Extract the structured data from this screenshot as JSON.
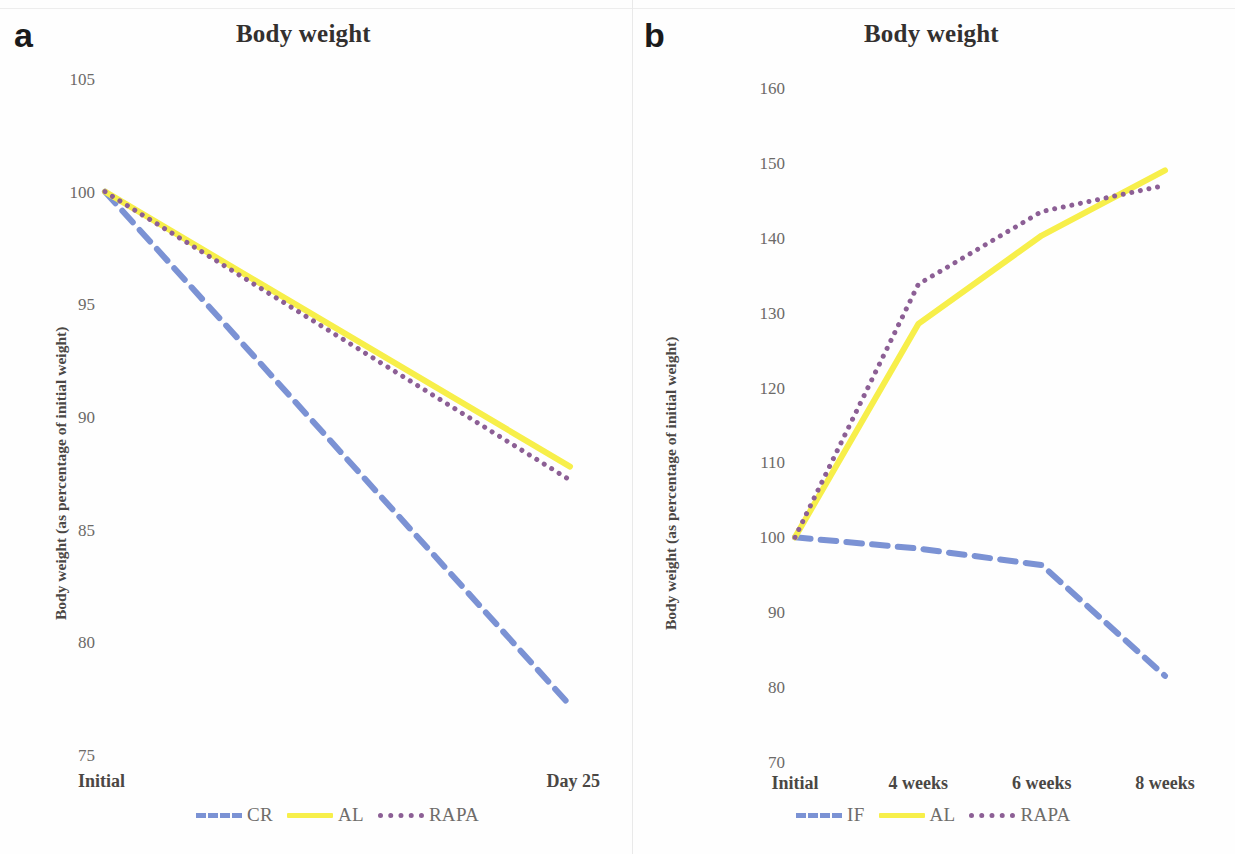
{
  "figure": {
    "panels": [
      {
        "id": "a",
        "label": "a",
        "title": "Body weight",
        "ylabel": "Body weight (as percentage of initial weight)"
      },
      {
        "id": "b",
        "label": "b",
        "title": "Body weight",
        "ylabel": "Body weight (as percentage of initial weight)"
      }
    ]
  },
  "chart_data": [
    {
      "type": "line",
      "panel": "a",
      "title": "Body weight",
      "xlabel": "",
      "ylabel": "Body weight (as percentage of initial weight)",
      "categories": [
        "Initial",
        "Day 25"
      ],
      "x_tick_labels": [
        "Initial",
        "Day 25"
      ],
      "y_tick_labels": [
        "105",
        "100",
        "95",
        "90",
        "85",
        "80",
        "75"
      ],
      "yticks": [
        105,
        100,
        95,
        90,
        85,
        80,
        75
      ],
      "ylim": [
        75,
        105
      ],
      "grid": false,
      "legend_position": "bottom",
      "series": [
        {
          "name": "CR",
          "values": [
            100,
            77.2
          ],
          "color": "#7b92d4",
          "style": "dashed"
        },
        {
          "name": "AL",
          "values": [
            100,
            87.8
          ],
          "color": "#f7ef4a",
          "style": "solid"
        },
        {
          "name": "RAPA",
          "values": [
            100,
            87.2
          ],
          "color": "#8c5f95",
          "style": "dotted"
        }
      ]
    },
    {
      "type": "line",
      "panel": "b",
      "title": "Body weight",
      "xlabel": "",
      "ylabel": "Body weight (as percentage of initial weight)",
      "categories": [
        "Initial",
        "4 weeks",
        "6 weeks",
        "8 weeks"
      ],
      "x_tick_labels": [
        "Initial",
        "4 weeks",
        "6 weeks",
        "8 weeks"
      ],
      "y_tick_labels": [
        "160",
        "150",
        "140",
        "130",
        "120",
        "110",
        "100",
        "90",
        "80",
        "70"
      ],
      "yticks": [
        160,
        150,
        140,
        130,
        120,
        110,
        100,
        90,
        80,
        70
      ],
      "ylim": [
        70,
        160
      ],
      "grid": false,
      "legend_position": "bottom",
      "series": [
        {
          "name": "IF",
          "values": [
            100,
            98.5,
            96.3,
            81.5
          ],
          "color": "#7b92d4",
          "style": "dashed"
        },
        {
          "name": "AL",
          "values": [
            100,
            128.5,
            140.3,
            149.0
          ],
          "color": "#f7ef4a",
          "style": "solid"
        },
        {
          "name": "RAPA",
          "values": [
            100,
            133.8,
            143.5,
            147.0
          ],
          "color": "#8c5f95",
          "style": "dotted"
        }
      ]
    }
  ],
  "colors": {
    "cr_if": "#7b92d4",
    "al": "#f7ef4a",
    "rapa": "#8c5f95",
    "tick_text": "#6c6a68",
    "title_text": "#33302f"
  }
}
